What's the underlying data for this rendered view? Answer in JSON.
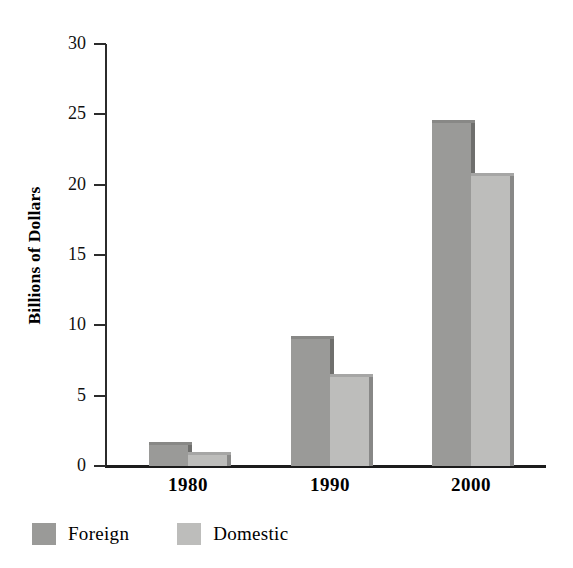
{
  "chart_data": {
    "type": "bar",
    "title": "",
    "subtitle": "",
    "xlabel": "",
    "ylabel": "Billions of Dollars",
    "categories": [
      "1980",
      "1990",
      "2000"
    ],
    "series": [
      {
        "name": "Foreign",
        "values": [
          1.5,
          9.0,
          24.4
        ],
        "color": "#9a9a98"
      },
      {
        "name": "Domestic",
        "values": [
          0.8,
          6.3,
          20.6
        ],
        "color": "#bdbdbb"
      }
    ],
    "ylim": [
      0,
      30
    ],
    "yticks": [
      0,
      5,
      10,
      15,
      20,
      25,
      30
    ],
    "ytick_labels": [
      "0",
      "5",
      "10",
      "15",
      "20",
      "25",
      "30"
    ],
    "grid": false,
    "legend_position": "bottom-left",
    "legend": [
      {
        "label": "Foreign",
        "color": "#9a9a98"
      },
      {
        "label": "Domestic",
        "color": "#bdbdbb"
      }
    ],
    "axis_color": "#1c1c1c",
    "background": "#ffffff"
  }
}
